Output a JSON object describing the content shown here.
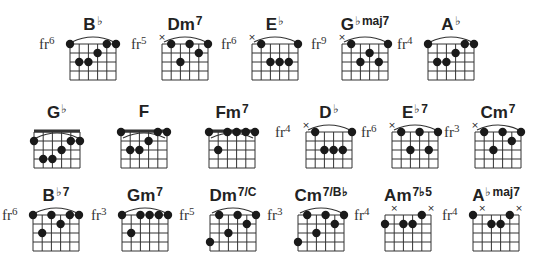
{
  "geometry": {
    "col_w": 9.2,
    "row_h": 9.0,
    "strings": 6,
    "frets": 4,
    "dot_r": 4.2
  },
  "chords": [
    {
      "name": "B",
      "acc": "♭",
      "ext": "",
      "fr": "6",
      "x": 70,
      "y": 44,
      "nut": false,
      "arc": true,
      "mutes": [],
      "dots": [
        [
          0,
          0
        ],
        [
          4,
          0
        ],
        [
          5,
          0
        ],
        [
          3,
          1
        ],
        [
          1,
          2
        ],
        [
          2,
          2
        ]
      ]
    },
    {
      "name": "Dm",
      "acc": "",
      "ext": "7",
      "fr": "5",
      "x": 162,
      "y": 44,
      "nut": false,
      "arc": true,
      "mutes": [
        0
      ],
      "dots": [
        [
          1,
          0
        ],
        [
          3,
          0
        ],
        [
          5,
          0
        ],
        [
          4,
          1
        ],
        [
          2,
          2
        ]
      ]
    },
    {
      "name": "E",
      "acc": "♭",
      "ext": "",
      "fr": "6",
      "x": 252,
      "y": 44,
      "nut": false,
      "arc": true,
      "mutes": [
        0
      ],
      "dots": [
        [
          1,
          0
        ],
        [
          5,
          0
        ],
        [
          2,
          2
        ],
        [
          3,
          2
        ],
        [
          4,
          2
        ]
      ]
    },
    {
      "name": "G",
      "acc": "♭",
      "ext": "maj7",
      "fr": "9",
      "x": 342,
      "y": 44,
      "nut": false,
      "arc": true,
      "mutes": [
        0
      ],
      "dots": [
        [
          1,
          0
        ],
        [
          5,
          0
        ],
        [
          3,
          1
        ],
        [
          2,
          2
        ],
        [
          4,
          2
        ]
      ]
    },
    {
      "name": "A",
      "acc": "♭",
      "ext": "",
      "fr": "4",
      "x": 428,
      "y": 44,
      "nut": false,
      "arc": true,
      "mutes": [],
      "dots": [
        [
          0,
          0
        ],
        [
          4,
          0
        ],
        [
          5,
          0
        ],
        [
          3,
          1
        ],
        [
          1,
          2
        ],
        [
          2,
          2
        ]
      ]
    },
    {
      "name": "G",
      "acc": "♭",
      "ext": "",
      "fr": "",
      "x": 34,
      "y": 132,
      "nut": true,
      "arc": true,
      "mutes": [],
      "dots": [
        [
          0,
          1
        ],
        [
          4,
          1
        ],
        [
          5,
          1
        ],
        [
          3,
          2
        ],
        [
          1,
          3
        ],
        [
          2,
          3
        ]
      ]
    },
    {
      "name": "F",
      "acc": "",
      "ext": "",
      "fr": "",
      "x": 121,
      "y": 132,
      "nut": true,
      "arc": true,
      "mutes": [],
      "dots": [
        [
          0,
          0
        ],
        [
          4,
          0
        ],
        [
          5,
          0
        ],
        [
          3,
          1
        ],
        [
          1,
          2
        ],
        [
          2,
          2
        ]
      ]
    },
    {
      "name": "Fm",
      "acc": "",
      "ext": "7",
      "fr": "",
      "x": 209,
      "y": 132,
      "nut": true,
      "arc": true,
      "mutes": [],
      "dots": [
        [
          0,
          0
        ],
        [
          2,
          0
        ],
        [
          3,
          0
        ],
        [
          4,
          0
        ],
        [
          5,
          0
        ],
        [
          1,
          2
        ]
      ]
    },
    {
      "name": "D",
      "acc": "♭",
      "ext": "",
      "fr": "4",
      "x": 306,
      "y": 132,
      "nut": false,
      "arc": true,
      "mutes": [
        0
      ],
      "dots": [
        [
          1,
          0
        ],
        [
          5,
          0
        ],
        [
          2,
          2
        ],
        [
          3,
          2
        ],
        [
          4,
          2
        ]
      ]
    },
    {
      "name": "E",
      "acc": "♭",
      "ext": "7",
      "fr": "6",
      "x": 392,
      "y": 132,
      "nut": false,
      "arc": true,
      "mutes": [
        0
      ],
      "dots": [
        [
          1,
          0
        ],
        [
          3,
          0
        ],
        [
          5,
          0
        ],
        [
          2,
          2
        ],
        [
          4,
          2
        ]
      ]
    },
    {
      "name": "Cm",
      "acc": "",
      "ext": "7",
      "fr": "3",
      "x": 475,
      "y": 132,
      "nut": false,
      "arc": true,
      "mutes": [
        0
      ],
      "dots": [
        [
          1,
          0
        ],
        [
          3,
          0
        ],
        [
          5,
          0
        ],
        [
          4,
          1
        ],
        [
          2,
          2
        ]
      ]
    },
    {
      "name": "B",
      "acc": "♭",
      "ext": "7",
      "fr": "6",
      "x": 33,
      "y": 215,
      "nut": false,
      "arc": true,
      "mutes": [],
      "dots": [
        [
          0,
          0
        ],
        [
          2,
          0
        ],
        [
          4,
          0
        ],
        [
          5,
          0
        ],
        [
          3,
          1
        ],
        [
          1,
          2
        ]
      ]
    },
    {
      "name": "Gm",
      "acc": "",
      "ext": "7",
      "fr": "3",
      "x": 122,
      "y": 215,
      "nut": false,
      "arc": true,
      "mutes": [],
      "dots": [
        [
          0,
          0
        ],
        [
          2,
          0
        ],
        [
          3,
          0
        ],
        [
          4,
          0
        ],
        [
          5,
          0
        ],
        [
          1,
          2
        ]
      ]
    },
    {
      "name": "Dm",
      "acc": "",
      "ext": "7/C",
      "fr": "5",
      "x": 210,
      "y": 215,
      "nut": false,
      "arc": true,
      "mutes": [],
      "dots": [
        [
          1,
          0
        ],
        [
          3,
          0
        ],
        [
          5,
          0
        ],
        [
          4,
          1
        ],
        [
          2,
          2
        ],
        [
          0,
          3
        ]
      ]
    },
    {
      "name": "Cm",
      "acc": "",
      "ext": "7/B♭",
      "fr": "3",
      "x": 298,
      "y": 215,
      "nut": false,
      "arc": true,
      "mutes": [],
      "dots": [
        [
          1,
          0
        ],
        [
          3,
          0
        ],
        [
          5,
          0
        ],
        [
          4,
          1
        ],
        [
          2,
          2
        ],
        [
          0,
          3
        ]
      ]
    },
    {
      "name": "Am",
      "acc": "",
      "ext": "7♭5",
      "fr": "4",
      "x": 385,
      "y": 215,
      "nut": false,
      "arc": false,
      "mutes": [
        1,
        5
      ],
      "dots": [
        [
          4,
          0
        ],
        [
          0,
          1
        ],
        [
          2,
          1
        ],
        [
          3,
          1
        ]
      ]
    },
    {
      "name": "A",
      "acc": "♭",
      "ext": "maj7",
      "fr": "4",
      "x": 473,
      "y": 215,
      "nut": false,
      "arc": false,
      "mutes": [
        1,
        5
      ],
      "dots": [
        [
          0,
          0
        ],
        [
          4,
          0
        ],
        [
          2,
          1
        ],
        [
          3,
          1
        ]
      ]
    }
  ],
  "labels": {
    "fr_prefix": "fr",
    "mute_glyph": "×"
  },
  "colors": {
    "ink": "#222222",
    "grid": "#333333",
    "bg": "#ffffff"
  }
}
